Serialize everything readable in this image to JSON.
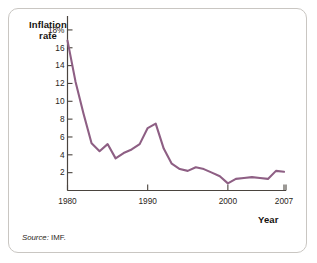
{
  "figure": {
    "source_note_prefix": "Source:",
    "source_note_body": "IMF.",
    "line_color": "#8e5f84",
    "axis_color": "#4a443e",
    "frame_color": "#c9c6c2"
  },
  "chart_data": {
    "type": "line",
    "title": "",
    "subtitle": "",
    "xlabel": "Year",
    "ylabel_line1": "Inflation",
    "ylabel_line2": "rate",
    "ylabel": "Inflation rate",
    "ytick_labels": [
      "18%",
      "16",
      "14",
      "12",
      "10",
      "8",
      "6",
      "4",
      "2"
    ],
    "ytick_values": [
      18,
      16,
      14,
      12,
      10,
      8,
      6,
      4,
      2
    ],
    "xtick_labels": [
      "1980",
      "1990",
      "2000",
      "2007"
    ],
    "xtick_values": [
      1980,
      1990,
      2000,
      2007
    ],
    "xlim": [
      1980,
      2007
    ],
    "ylim": [
      0,
      19
    ],
    "grid": false,
    "legend": false,
    "series": [
      {
        "name": "Inflation rate",
        "color": "#8e5f84",
        "x": [
          1980,
          1981,
          1982,
          1983,
          1984,
          1985,
          1986,
          1987,
          1988,
          1989,
          1990,
          1991,
          1992,
          1993,
          1994,
          1995,
          1996,
          1997,
          1998,
          1999,
          2000,
          2001,
          2002,
          2003,
          2004,
          2005,
          2006,
          2007
        ],
        "values": [
          16.8,
          12.2,
          8.6,
          5.3,
          4.4,
          5.2,
          3.6,
          4.2,
          4.6,
          5.2,
          7.0,
          7.5,
          4.7,
          3.0,
          2.4,
          2.2,
          2.6,
          2.4,
          2.0,
          1.6,
          0.8,
          1.3,
          1.4,
          1.5,
          1.4,
          1.3,
          2.2,
          2.1
        ]
      }
    ]
  }
}
